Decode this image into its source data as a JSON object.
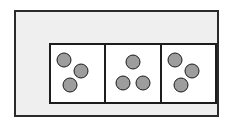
{
  "figure": {
    "background_color": "#ffffff",
    "frame": {
      "label": "outer frame",
      "fill_color": "#f0efef",
      "border_color": "#2b2b2b",
      "border_width_px": 2
    },
    "panel_group": {
      "label": "panel row",
      "border_color": "#1d1d1d",
      "divider_color": "#1d1d1d",
      "panel_fill_color": "#ffffff",
      "panel_count": 3
    },
    "pip_style": {
      "fill_color": "#9d9d9d",
      "border_color": "#1a1a1a",
      "diameter_px": 15,
      "shape": "circle"
    },
    "total_dots": 9,
    "panels": [
      {
        "name": "panel-left",
        "dot_count": 3,
        "arrangement": "diagonal",
        "dots": [
          {
            "name": "dot-top-left",
            "x_pct": 25,
            "y_pct": 27
          },
          {
            "name": "dot-middle-right",
            "x_pct": 57,
            "y_pct": 45
          },
          {
            "name": "dot-bottom-left",
            "x_pct": 36,
            "y_pct": 70
          }
        ]
      },
      {
        "name": "panel-center",
        "dot_count": 3,
        "arrangement": "triangle",
        "dots": [
          {
            "name": "dot-top-center",
            "x_pct": 50,
            "y_pct": 30
          },
          {
            "name": "dot-bottom-left",
            "x_pct": 31,
            "y_pct": 67
          },
          {
            "name": "dot-bottom-right",
            "x_pct": 69,
            "y_pct": 67
          }
        ]
      },
      {
        "name": "panel-right",
        "dot_count": 3,
        "arrangement": "diagonal",
        "dots": [
          {
            "name": "dot-top-left",
            "x_pct": 25,
            "y_pct": 27
          },
          {
            "name": "dot-middle-right",
            "x_pct": 57,
            "y_pct": 45
          },
          {
            "name": "dot-bottom-left",
            "x_pct": 36,
            "y_pct": 70
          }
        ]
      }
    ]
  }
}
